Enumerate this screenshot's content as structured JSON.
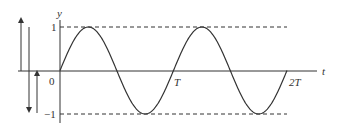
{
  "diagram": {
    "type": "sine-wave-graph",
    "axes": {
      "y_label": "y",
      "x_label": "t",
      "origin_label": "0",
      "y_max_label": "1",
      "y_min_label": "−1",
      "x_tick_labels": [
        "T",
        "2T"
      ]
    },
    "curve": {
      "function": "sin",
      "periods": 2,
      "color": "#333333"
    },
    "reference_lines": [
      {
        "name": "amplitude-max",
        "value": 1,
        "style": "dashed"
      },
      {
        "name": "amplitude-min",
        "value": -1,
        "style": "dashed"
      }
    ],
    "side_arrows": [
      {
        "name": "up-arrow-left",
        "direction": "up"
      },
      {
        "name": "down-arrow",
        "direction": "down"
      },
      {
        "name": "up-arrow-right",
        "direction": "up"
      }
    ]
  }
}
